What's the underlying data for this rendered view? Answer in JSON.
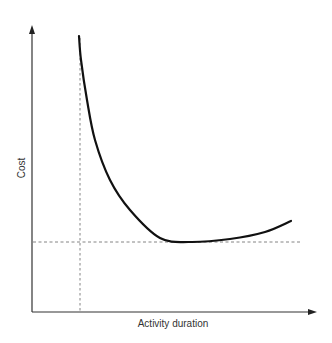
{
  "chart_data": {
    "type": "line",
    "title": "",
    "xlabel": "Activity duration",
    "ylabel": "Cost",
    "grid": false,
    "legend": null,
    "axis_ticks": "none",
    "series": [
      {
        "name": "Cost curve",
        "points_px": [
          [
            79,
            36
          ],
          [
            81,
            60
          ],
          [
            87,
            100
          ],
          [
            95,
            140
          ],
          [
            110,
            180
          ],
          [
            130,
            210
          ],
          [
            160,
            238
          ],
          [
            190,
            242
          ],
          [
            230,
            239
          ],
          [
            265,
            232
          ],
          [
            291,
            221
          ]
        ]
      }
    ],
    "reference_lines": [
      {
        "orientation": "vertical",
        "label": "minimum duration",
        "x_px": 80,
        "style": "dashed"
      },
      {
        "orientation": "horizontal",
        "label": "minimum cost",
        "y_px": 242,
        "style": "dashed"
      }
    ],
    "axes": {
      "origin_px": [
        32,
        312
      ],
      "x_arrow_tip_px": [
        316,
        312
      ],
      "y_arrow_tip_px": [
        32,
        26
      ]
    },
    "colors": {
      "curve": "#111111",
      "axes": "#333333",
      "dashed": "#777777"
    }
  }
}
